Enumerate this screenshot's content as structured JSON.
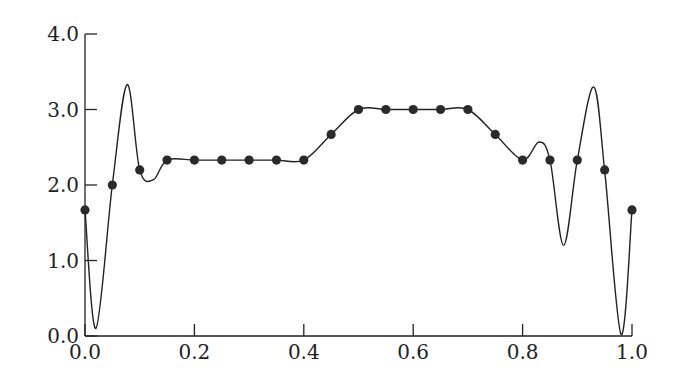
{
  "chart_data": {
    "type": "line",
    "title": "",
    "xlabel": "",
    "ylabel": "",
    "xlim": [
      0.0,
      1.0
    ],
    "ylim": [
      0.0,
      4.0
    ],
    "grid": false,
    "legend": null,
    "x_ticks": [
      "0.0",
      "0.2",
      "0.4",
      "0.6",
      "0.8",
      "1.0"
    ],
    "y_ticks": [
      "0.0",
      "1.0",
      "2.0",
      "3.0",
      "4.0"
    ],
    "series": [
      {
        "name": "sample points",
        "style": "scatter-markers",
        "x": [
          0.0,
          0.05,
          0.1,
          0.15,
          0.2,
          0.25,
          0.3,
          0.35,
          0.4,
          0.45,
          0.5,
          0.55,
          0.6,
          0.65,
          0.7,
          0.75,
          0.8,
          0.85,
          0.9,
          0.95,
          1.0
        ],
        "values": [
          1.67,
          2.0,
          2.2,
          2.33,
          2.33,
          2.33,
          2.33,
          2.33,
          2.33,
          2.67,
          3.0,
          3.0,
          3.0,
          3.0,
          3.0,
          2.67,
          2.33,
          2.33,
          2.33,
          2.2,
          1.67
        ]
      },
      {
        "name": "interpolating curve",
        "style": "smooth-line",
        "x": [
          0.0,
          0.02,
          0.05,
          0.077,
          0.1,
          0.125,
          0.15,
          0.2,
          0.25,
          0.3,
          0.35,
          0.4,
          0.45,
          0.5,
          0.55,
          0.6,
          0.65,
          0.7,
          0.75,
          0.8,
          0.83,
          0.85,
          0.875,
          0.9,
          0.93,
          0.95,
          0.98,
          1.0
        ],
        "values": [
          1.67,
          0.1,
          2.0,
          3.33,
          2.2,
          2.07,
          2.33,
          2.33,
          2.33,
          2.33,
          2.33,
          2.33,
          2.67,
          3.0,
          3.0,
          3.0,
          3.0,
          3.0,
          2.67,
          2.33,
          2.57,
          2.33,
          1.2,
          2.33,
          3.3,
          2.2,
          0.02,
          1.67
        ]
      }
    ]
  }
}
